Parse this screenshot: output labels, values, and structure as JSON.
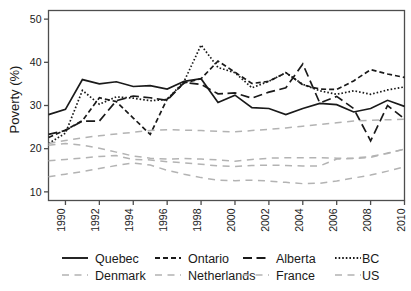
{
  "chart_data": {
    "type": "line",
    "title": "",
    "xlabel": "",
    "ylabel": "Poverty (%)",
    "xlim": [
      1989,
      2010
    ],
    "ylim": [
      8,
      52
    ],
    "yticks": [
      10,
      20,
      30,
      40,
      50
    ],
    "xticks": [
      1990,
      1992,
      1994,
      1996,
      1998,
      2000,
      2002,
      2004,
      2006,
      2008,
      2010
    ],
    "ytick_labels": [
      "10",
      "20",
      "30",
      "40",
      "50"
    ],
    "xtick_labels": [
      "1990",
      "1992",
      "1994",
      "1996",
      "1998",
      "2000",
      "2002",
      "2004",
      "2006",
      "2008",
      "2010"
    ],
    "grid": false,
    "legend_position": "bottom",
    "x": [
      1989,
      1990,
      1991,
      1992,
      1993,
      1994,
      1995,
      1996,
      1997,
      1998,
      1999,
      2000,
      2001,
      2002,
      2003,
      2004,
      2005,
      2006,
      2007,
      2008,
      2009,
      2010
    ],
    "series": [
      {
        "name": "Quebec",
        "color": "#1a1a1a",
        "style": "solid",
        "values": [
          27.9,
          29.1,
          36.0,
          35.0,
          35.5,
          34.4,
          34.6,
          33.8,
          35.6,
          36.2,
          30.7,
          32.4,
          29.5,
          29.3,
          27.9,
          29.3,
          30.5,
          30.2,
          28.5,
          29.3,
          31.2,
          29.8
        ]
      },
      {
        "name": "Ontario",
        "color": "#1a1a1a",
        "style": "dashed",
        "values": [
          22.6,
          24.3,
          26.5,
          31.8,
          30.9,
          27.1,
          23.3,
          31.5,
          35.2,
          36.2,
          40.3,
          37.7,
          35.1,
          35.6,
          37.6,
          34.8,
          33.8,
          33.7,
          35.7,
          38.3,
          37.3,
          36.5
        ]
      },
      {
        "name": "Alberta",
        "color": "#1a1a1a",
        "style": "longdash",
        "values": [
          23.3,
          24.2,
          26.4,
          26.4,
          31.1,
          32.2,
          31.8,
          31.2,
          35.3,
          34.9,
          32.7,
          32.9,
          31.7,
          33.1,
          34.1,
          39.6,
          30.6,
          32.1,
          29.3,
          21.8,
          30.0,
          26.9
        ]
      },
      {
        "name": "BC",
        "color": "#1a1a1a",
        "style": "dotted",
        "values": [
          21.2,
          23.6,
          33.5,
          30.3,
          32.0,
          31.7,
          31.1,
          31.4,
          35.6,
          44.0,
          38.8,
          37.6,
          34.1,
          35.6,
          37.6,
          34.9,
          33.4,
          32.6,
          33.4,
          32.6,
          33.6,
          34.3
        ]
      },
      {
        "name": "Denmark",
        "color": "#b3b3b3",
        "style": "dashed",
        "values": [
          17.2,
          17.5,
          17.8,
          18.2,
          18.4,
          17.5,
          17.4,
          17.0,
          16.7,
          16.4,
          16.0,
          15.9,
          16.1,
          16.2,
          16.1,
          16.0,
          16.0,
          17.6,
          17.7,
          18.0,
          19.0,
          19.9
        ]
      },
      {
        "name": "Netherlands",
        "color": "#b3b3b3",
        "style": "dashed",
        "values": [
          20.8,
          21.2,
          20.8,
          20.1,
          19.2,
          18.3,
          17.8,
          17.6,
          17.7,
          17.6,
          17.4,
          17.1,
          17.5,
          17.8,
          17.9,
          17.9,
          17.9,
          17.8,
          17.8,
          18.2,
          18.9,
          19.9
        ]
      },
      {
        "name": "France",
        "color": "#b3b3b3",
        "style": "dashed",
        "values": [
          13.5,
          14.1,
          14.7,
          15.4,
          16.1,
          16.7,
          16.2,
          15.0,
          14.1,
          13.3,
          12.7,
          12.6,
          12.7,
          12.5,
          12.2,
          11.9,
          12.0,
          12.5,
          13.2,
          13.9,
          14.8,
          15.8
        ]
      },
      {
        "name": "US",
        "color": "#b3b3b3",
        "style": "dashed",
        "values": [
          21.2,
          21.9,
          22.5,
          23.0,
          23.4,
          23.8,
          24.2,
          24.4,
          24.3,
          24.2,
          24.0,
          23.9,
          24.2,
          24.5,
          24.8,
          25.2,
          25.6,
          26.0,
          26.4,
          26.6,
          26.7,
          26.8
        ]
      }
    ]
  },
  "legend": {
    "rows": [
      [
        {
          "label": "Quebec",
          "style": "solid",
          "color": "#1a1a1a"
        },
        {
          "label": "Ontario",
          "style": "dashed",
          "color": "#1a1a1a"
        },
        {
          "label": "Alberta",
          "style": "longdash",
          "color": "#1a1a1a"
        },
        {
          "label": "BC",
          "style": "dotted",
          "color": "#1a1a1a"
        }
      ],
      [
        {
          "label": "Denmark",
          "style": "dashed",
          "color": "#b3b3b3"
        },
        {
          "label": "Netherlands",
          "style": "dashed",
          "color": "#b3b3b3"
        },
        {
          "label": "France",
          "style": "dashed",
          "color": "#b3b3b3"
        },
        {
          "label": "US",
          "style": "dashed",
          "color": "#b3b3b3"
        }
      ]
    ]
  },
  "colors": {
    "axis": "#4d4d4d",
    "text": "#1a1a1a",
    "domestic_series": "#1a1a1a",
    "international_series": "#b3b3b3",
    "background": "#ffffff"
  }
}
